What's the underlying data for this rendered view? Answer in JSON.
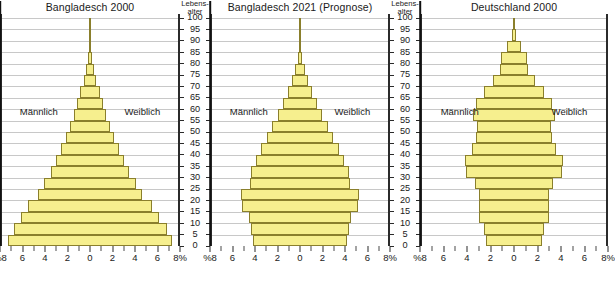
{
  "figure": {
    "age_axis_title_line1": "Lebens-",
    "age_axis_title_line2": "alter",
    "age_ticks": [
      100,
      95,
      90,
      85,
      80,
      75,
      70,
      65,
      60,
      55,
      50,
      45,
      40,
      35,
      30,
      25,
      20,
      15,
      10,
      5,
      0
    ],
    "x_tick_labels": [
      "%8",
      "6",
      "4",
      "2",
      "0",
      "2",
      "4",
      "6",
      "8%"
    ],
    "x_tick_values": [
      -8,
      -6,
      -4,
      -2,
      0,
      2,
      4,
      6,
      8
    ],
    "x_minor_values": [
      -7,
      -5,
      -3,
      -1,
      1,
      3,
      5,
      7
    ],
    "male_label": "Männlich",
    "female_label": "Weiblich",
    "bar_fill": "#f6ef8e",
    "bar_stroke": "#8a7f2c",
    "grid_color": "#c8c8c8",
    "axis_color": "#2b2b2b"
  },
  "chart_data": [
    {
      "type": "bar",
      "title": "Bangladesch 2000",
      "subtype": "population-pyramid",
      "xlabel": "%",
      "ylabel": "Lebensalter",
      "xlim": [
        -8,
        8
      ],
      "ylim": [
        0,
        100
      ],
      "grid": true,
      "legend": [
        "Männlich",
        "Weiblich"
      ],
      "categories": [
        "0-4",
        "5-9",
        "10-14",
        "15-19",
        "20-24",
        "25-29",
        "30-34",
        "35-39",
        "40-44",
        "45-49",
        "50-54",
        "55-59",
        "60-64",
        "65-69",
        "70-74",
        "75-79",
        "80-84",
        "85-89",
        "90-94",
        "95-99"
      ],
      "series": [
        {
          "name": "Männlich",
          "values": [
            7.4,
            6.9,
            6.2,
            5.6,
            4.7,
            4.1,
            3.6,
            3.1,
            2.6,
            2.2,
            1.8,
            1.5,
            1.2,
            0.9,
            0.6,
            0.35,
            0.18,
            0.07,
            0.02,
            0.01
          ]
        },
        {
          "name": "Weiblich",
          "values": [
            7.2,
            6.7,
            6.0,
            5.4,
            4.6,
            4.0,
            3.4,
            2.9,
            2.5,
            2.1,
            1.7,
            1.4,
            1.1,
            0.8,
            0.55,
            0.32,
            0.16,
            0.06,
            0.02,
            0.01
          ]
        }
      ]
    },
    {
      "type": "bar",
      "title": "Bangladesch 2021 (Prognose)",
      "subtype": "population-pyramid",
      "xlabel": "%",
      "ylabel": "Lebensalter",
      "xlim": [
        -8,
        8
      ],
      "ylim": [
        0,
        100
      ],
      "grid": true,
      "legend": [
        "Männlich",
        "Weiblich"
      ],
      "categories": [
        "0-4",
        "5-9",
        "10-14",
        "15-19",
        "20-24",
        "25-29",
        "30-34",
        "35-39",
        "40-44",
        "45-49",
        "50-54",
        "55-59",
        "60-64",
        "65-69",
        "70-74",
        "75-79",
        "80-84",
        "85-89",
        "90-94",
        "95-99"
      ],
      "series": [
        {
          "name": "Männlich",
          "values": [
            4.3,
            4.4,
            4.6,
            5.2,
            5.3,
            4.5,
            4.4,
            4.0,
            3.5,
            3.0,
            2.5,
            2.0,
            1.5,
            1.1,
            0.75,
            0.45,
            0.22,
            0.08,
            0.02,
            0.01
          ]
        },
        {
          "name": "Weiblich",
          "values": [
            4.1,
            4.3,
            4.5,
            5.1,
            5.2,
            4.4,
            4.3,
            3.9,
            3.4,
            2.9,
            2.4,
            1.9,
            1.45,
            1.05,
            0.72,
            0.44,
            0.22,
            0.09,
            0.03,
            0.01
          ]
        }
      ]
    },
    {
      "type": "bar",
      "title": "Deutschland 2000",
      "subtype": "population-pyramid",
      "xlabel": "%",
      "ylabel": "Lebensalter",
      "xlim": [
        -8,
        8
      ],
      "ylim": [
        0,
        100
      ],
      "grid": true,
      "legend": [
        "Männlich",
        "Weiblich"
      ],
      "categories": [
        "0-4",
        "5-9",
        "10-14",
        "15-19",
        "20-24",
        "25-29",
        "30-34",
        "35-39",
        "40-44",
        "45-49",
        "50-54",
        "55-59",
        "60-64",
        "65-69",
        "70-74",
        "75-79",
        "80-84",
        "85-89",
        "90-94",
        "95-99"
      ],
      "series": [
        {
          "name": "Männlich",
          "values": [
            2.4,
            2.6,
            3.0,
            3.0,
            3.0,
            3.4,
            4.2,
            4.3,
            3.6,
            3.3,
            3.2,
            3.5,
            3.2,
            2.4,
            1.5,
            0.9,
            0.8,
            0.4,
            0.12,
            0.03
          ]
        },
        {
          "name": "Weiblich",
          "values": [
            2.3,
            2.5,
            2.9,
            2.9,
            2.9,
            3.3,
            4.0,
            4.1,
            3.5,
            3.2,
            3.1,
            3.5,
            3.3,
            2.7,
            2.0,
            1.5,
            1.4,
            0.8,
            0.3,
            0.07
          ]
        }
      ]
    }
  ]
}
